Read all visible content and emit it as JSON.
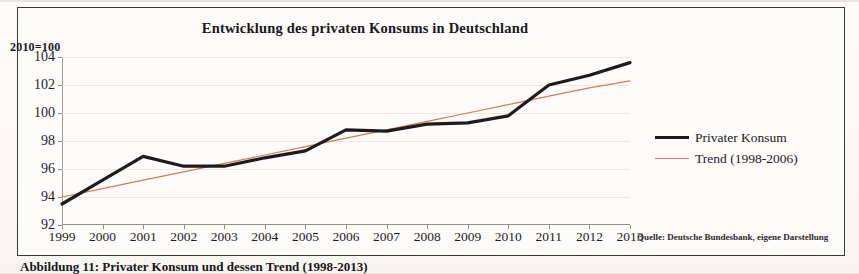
{
  "figure": {
    "title": "Entwicklung des privaten Konsums in Deutschland",
    "y_unit_label": "2010=100",
    "source_note": "Quelle: Deutsche Bundesbank, eigene Darstellung",
    "caption": "Abbildung 11: Privater Konsum und dessen Trend (1998-2013)"
  },
  "legend": {
    "items": [
      {
        "label": "Privater Konsum",
        "color": "#1c1c1c"
      },
      {
        "label": "Trend (1998-2006)",
        "color": "#d9785c"
      }
    ]
  },
  "chart_data": {
    "type": "line",
    "title": "Entwicklung des privaten Konsums in Deutschland",
    "xlabel": "",
    "ylabel": "2010=100",
    "ylim": [
      92,
      104
    ],
    "yticks": [
      92,
      94,
      96,
      98,
      100,
      102,
      104
    ],
    "grid": true,
    "legend_position": "right",
    "categories": [
      "1999",
      "2000",
      "2001",
      "2002",
      "2003",
      "2004",
      "2005",
      "2006",
      "2007",
      "2008",
      "2009",
      "2010",
      "2011",
      "2012",
      "2013"
    ],
    "series": [
      {
        "name": "Privater Konsum",
        "color": "#1c1c1c",
        "values": [
          93.5,
          95.2,
          96.9,
          96.2,
          96.2,
          96.8,
          97.3,
          98.8,
          98.7,
          99.2,
          99.3,
          99.8,
          102.0,
          102.7,
          103.6
        ]
      },
      {
        "name": "Trend (1998-2006)",
        "color": "#d9785c",
        "values": [
          94.0,
          94.6,
          95.2,
          95.8,
          96.4,
          97.0,
          97.6,
          98.2,
          98.8,
          99.4,
          100.0,
          100.6,
          101.2,
          101.8,
          102.3
        ]
      }
    ]
  }
}
